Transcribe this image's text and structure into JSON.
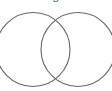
{
  "diagram": {
    "type": "venn",
    "caption": "g",
    "stroke_color": "#666666",
    "circles": [
      {
        "name": "left-circle",
        "cx": 33,
        "cy": 49.5,
        "r": 37
      },
      {
        "name": "right-circle",
        "cx": 78,
        "cy": 49.5,
        "r": 37
      }
    ]
  }
}
